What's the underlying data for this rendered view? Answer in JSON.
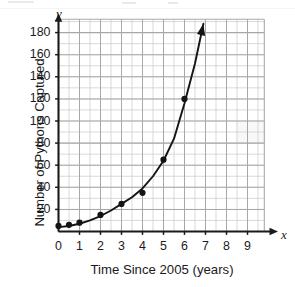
{
  "figure": {
    "y_axis_title": "Number of Pythons Captured",
    "x_axis_title": "Time Since 2005 (years)",
    "y_axis_letter": "y",
    "x_axis_letter": "x",
    "origin_label": "0"
  },
  "chart_data": {
    "type": "scatter",
    "title": "",
    "subtitle": "",
    "xlabel": "Time Since 2005 (years)",
    "ylabel": "Number of Pythons Captured",
    "xlim": [
      0,
      9.8
    ],
    "ylim": [
      0,
      192
    ],
    "grid": true,
    "grid_major_x_step": 1,
    "grid_minor_x_step": 0.5,
    "grid_major_y_step": 20,
    "grid_minor_y_step": 10,
    "legend": "none",
    "x_tick_labels": [
      "0",
      "1",
      "2",
      "3",
      "4",
      "5",
      "6",
      "7",
      "8",
      "9"
    ],
    "x_ticks": [
      0,
      1,
      2,
      3,
      4,
      5,
      6,
      7,
      8,
      9
    ],
    "y_tick_labels": [
      "20",
      "40",
      "60",
      "80",
      "100",
      "120",
      "140",
      "160",
      "180"
    ],
    "y_ticks": [
      20,
      40,
      60,
      80,
      100,
      120,
      140,
      160,
      180
    ],
    "points": [
      {
        "x": 0.0,
        "y": 5
      },
      {
        "x": 0.5,
        "y": 6
      },
      {
        "x": 1.0,
        "y": 8
      },
      {
        "x": 2.0,
        "y": 15
      },
      {
        "x": 3.0,
        "y": 25
      },
      {
        "x": 4.0,
        "y": 35
      },
      {
        "x": 5.0,
        "y": 65
      },
      {
        "x": 6.0,
        "y": 120
      }
    ],
    "fit_curve": {
      "kind": "exponential",
      "description": "hand-drawn exponential trend curve through the plotted points, ending in an upward arrowhead",
      "points": [
        {
          "x": 0.0,
          "y": 4
        },
        {
          "x": 0.5,
          "y": 5
        },
        {
          "x": 1.0,
          "y": 7
        },
        {
          "x": 1.5,
          "y": 10
        },
        {
          "x": 2.0,
          "y": 14
        },
        {
          "x": 2.5,
          "y": 19
        },
        {
          "x": 3.0,
          "y": 25
        },
        {
          "x": 3.5,
          "y": 31
        },
        {
          "x": 4.0,
          "y": 39
        },
        {
          "x": 4.5,
          "y": 50
        },
        {
          "x": 5.0,
          "y": 64
        },
        {
          "x": 5.5,
          "y": 84
        },
        {
          "x": 6.0,
          "y": 116
        },
        {
          "x": 6.5,
          "y": 152
        },
        {
          "x": 6.9,
          "y": 188
        }
      ],
      "arrow_at_end": true
    },
    "annotations": [],
    "colors": {
      "axis": "#1b1b1b",
      "grid_major": "#a8a8a8",
      "grid_minor": "#cfcfcf",
      "point": "#141414",
      "curve": "#141414",
      "background": "#ffffff"
    }
  }
}
